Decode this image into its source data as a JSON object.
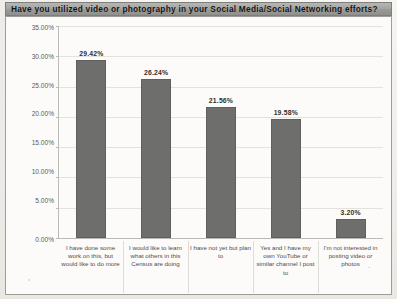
{
  "title": "Have you utilized video or photography in your Social Media/Social Networking efforts?",
  "axis": {
    "yticks": [
      "0.00%",
      "5.00%",
      "10.00%",
      "15.00%",
      "20.00%",
      "25.00%",
      "30.00%",
      "35.00%"
    ]
  },
  "chart_data": {
    "type": "bar",
    "title": "Have you utilized video or photography in your Social Media/Social Networking efforts?",
    "xlabel": "",
    "ylabel": "",
    "ylim": [
      0,
      35
    ],
    "ytick_step": 5,
    "grid": true,
    "legend": "none",
    "bar_color": "#6e6e6d",
    "categories": [
      "I have done some work on this, but would like to do more",
      "I would like to learn what others in this Census are doing",
      "I have not yet but plan to",
      "Yes and I have my own YouTube or similar channel I post to",
      "I'm not interested in posting video or photos"
    ],
    "values": [
      29.42,
      26.24,
      21.56,
      19.58,
      3.2
    ],
    "value_labels": [
      "29.42%",
      "26.24%",
      "21.56%",
      "19.58%",
      "3.20%"
    ]
  }
}
